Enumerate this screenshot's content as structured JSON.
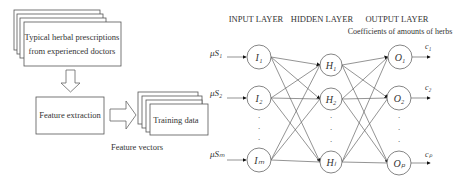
{
  "left_flow": {
    "prescriptions_box": {
      "line1": "Typical herbal prescriptions",
      "line2": "from experienced doctors"
    },
    "feature_extraction_box": {
      "label": "Feature extraction"
    },
    "training_data_box": {
      "label": "Training data"
    },
    "feature_vectors_caption": "Feature vectors"
  },
  "network": {
    "layer_titles": {
      "input": "INPUT LAYER",
      "hidden": "HIDDEN LAYER",
      "output": "OUTPUT LAYER"
    },
    "output_caption": "Coefficients of amounts of herbs",
    "inputs": [
      {
        "label": "μS₁",
        "node": "I₁"
      },
      {
        "label": "μS₂",
        "node": "I₂"
      },
      {
        "label": "μSₘ",
        "node": "Iₘ"
      }
    ],
    "hidden": [
      {
        "node": "H₁"
      },
      {
        "node": "H₂"
      },
      {
        "node": "Hₗ"
      }
    ],
    "outputs": [
      {
        "node": "O₁",
        "coef": "c₁"
      },
      {
        "node": "O₂",
        "coef": "c₂"
      },
      {
        "node": "Oₚ",
        "coef": "cₚ"
      }
    ]
  }
}
